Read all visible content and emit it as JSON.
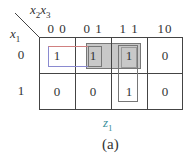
{
  "kmap": {
    "row_var": "x",
    "row_var_sub": "1",
    "col_var_a": "x",
    "col_var_a_sub": "2",
    "col_var_b": "x",
    "col_var_b_sub": "3",
    "col_headers": [
      "0 0",
      "0 1",
      "1 1",
      "10"
    ],
    "row_headers": [
      "0",
      "1"
    ],
    "cells": [
      [
        "1",
        "1",
        "1",
        "0"
      ],
      [
        "0",
        "0",
        "1",
        "0"
      ]
    ],
    "groups": [
      {
        "name": "x1'x2'",
        "cells": [
          [
            0,
            0
          ],
          [
            0,
            1
          ]
        ],
        "color": "#d08080"
      },
      {
        "name": "x1'x3 (shaded)",
        "cells": [
          [
            0,
            1
          ],
          [
            0,
            2
          ]
        ],
        "color": "#888888",
        "fill": "#c8c8c8"
      },
      {
        "name": "x2x3",
        "cells": [
          [
            0,
            2
          ],
          [
            1,
            2
          ]
        ],
        "color": "#777777"
      }
    ]
  },
  "function_label": "z",
  "function_label_sub": "1",
  "caption": "(a)",
  "colors": {
    "function_label": "#3a8f9a",
    "grid": "#444444",
    "shade": "#c8c8c8"
  }
}
